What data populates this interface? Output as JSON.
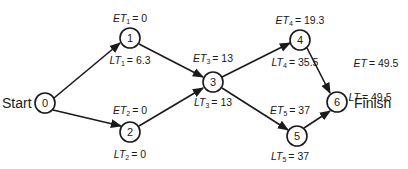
{
  "diagram": {
    "type": "pert-network",
    "start_label": "Start",
    "finish_label": "Finish",
    "nodes": [
      {
        "id": "0",
        "label": "0",
        "x": 45,
        "y": 103
      },
      {
        "id": "1",
        "label": "1",
        "x": 130,
        "y": 38,
        "et_var": "ET",
        "et_sub": "1",
        "et_value": "= 0",
        "lt_var": "LT",
        "lt_sub": "1",
        "lt_value": "= 6.3"
      },
      {
        "id": "2",
        "label": "2",
        "x": 130,
        "y": 132,
        "et_var": "ET",
        "et_sub": "2",
        "et_value": "= 0",
        "lt_var": "LT",
        "lt_sub": "2",
        "lt_value": "= 0"
      },
      {
        "id": "3",
        "label": "3",
        "x": 213,
        "y": 82,
        "et_var": "ET",
        "et_sub": "3",
        "et_value": "= 13",
        "lt_var": "LT",
        "lt_sub": "3",
        "lt_value": "= 13"
      },
      {
        "id": "4",
        "label": "4",
        "x": 300,
        "y": 40,
        "et_var": "ET",
        "et_sub": "4",
        "et_value": "= 19.3",
        "lt_var": "LT",
        "lt_sub": "4",
        "lt_value": "= 35.5"
      },
      {
        "id": "5",
        "label": "5",
        "x": 297,
        "y": 136,
        "et_var": "ET",
        "et_sub": "5",
        "et_value": "= 37",
        "lt_var": "LT",
        "lt_sub": "5",
        "lt_value": "= 37"
      },
      {
        "id": "6",
        "label": "6",
        "x": 337,
        "y": 102,
        "et_var": "ET",
        "et_sub": "",
        "et_value": "= 49.5",
        "lt_var": "LT",
        "lt_sub": "",
        "lt_value": "= 49.5"
      }
    ],
    "edges": [
      {
        "from": "0",
        "to": "1"
      },
      {
        "from": "0",
        "to": "2"
      },
      {
        "from": "1",
        "to": "3"
      },
      {
        "from": "2",
        "to": "3"
      },
      {
        "from": "3",
        "to": "4"
      },
      {
        "from": "3",
        "to": "5"
      },
      {
        "from": "4",
        "to": "6"
      },
      {
        "from": "5",
        "to": "6"
      }
    ],
    "colors": {
      "stroke": "#1a1a1a",
      "background": "#ffffff"
    }
  }
}
